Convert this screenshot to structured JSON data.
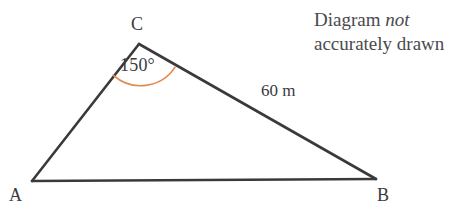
{
  "diagram": {
    "type": "triangle",
    "note": {
      "line1_prefix": "Diagram ",
      "line1_emphasis": "not",
      "line2": "accurately drawn"
    },
    "vertices": [
      {
        "id": "A",
        "label": "A",
        "x": 32,
        "y": 181
      },
      {
        "id": "B",
        "label": "B",
        "x": 376,
        "y": 179
      },
      {
        "id": "C",
        "label": "C",
        "x": 139,
        "y": 44
      }
    ],
    "sides": [
      {
        "from": "A",
        "to": "B",
        "label": ""
      },
      {
        "from": "A",
        "to": "C",
        "label": ""
      },
      {
        "from": "C",
        "to": "B",
        "label": "60 m",
        "value": 60,
        "unit": "m"
      }
    ],
    "angles": [
      {
        "at": "C",
        "label": "150°",
        "value": 150,
        "unit": "degrees",
        "arc": true
      }
    ],
    "colors": {
      "stroke": "#3a3a3e",
      "arc": "#e08a50",
      "text": "#3a3a3e",
      "note_text": "#4a4a4e",
      "background": "#ffffff"
    }
  }
}
